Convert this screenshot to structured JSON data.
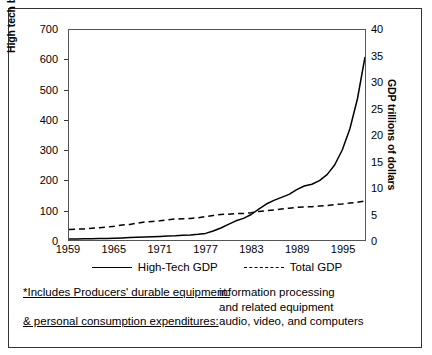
{
  "chart_data": {
    "type": "line",
    "title": "",
    "xlabel": "",
    "x": [
      1959,
      1960,
      1961,
      1962,
      1963,
      1964,
      1965,
      1966,
      1967,
      1968,
      1969,
      1970,
      1971,
      1972,
      1973,
      1974,
      1975,
      1976,
      1977,
      1978,
      1979,
      1980,
      1981,
      1982,
      1983,
      1984,
      1985,
      1986,
      1987,
      1988,
      1989,
      1990,
      1991,
      1992,
      1993,
      1994,
      1995,
      1996,
      1997,
      1998
    ],
    "xtick_labels": [
      "1959",
      "1965",
      "1971",
      "1977",
      "1983",
      "1989",
      "1995"
    ],
    "xticks": [
      1959,
      1965,
      1971,
      1977,
      1983,
      1989,
      1995
    ],
    "xlim": [
      1959,
      1998
    ],
    "grid": false,
    "legend_position": "below-plot",
    "left_axis": {
      "label": "High tech billions of dollars",
      "ylim": [
        0,
        700
      ],
      "ticks": [
        0,
        100,
        200,
        300,
        400,
        500,
        600,
        700
      ],
      "tick_labels": [
        "0",
        "100",
        "200",
        "300",
        "400",
        "500",
        "600",
        "700"
      ],
      "units": "billions of dollars"
    },
    "right_axis": {
      "label": "GDP trillions of dollars",
      "ylim": [
        0,
        40
      ],
      "ticks": [
        0,
        5,
        10,
        15,
        20,
        25,
        30,
        35,
        40
      ],
      "tick_labels": [
        "0",
        "5",
        "10",
        "15",
        "20",
        "25",
        "30",
        "35",
        "40"
      ],
      "units": "trillions of dollars"
    },
    "series": [
      {
        "name": "High-Tech GDP",
        "style": "solid",
        "axis": "left",
        "color": "#000000",
        "values": [
          3,
          3,
          4,
          4,
          5,
          5,
          6,
          7,
          8,
          9,
          10,
          11,
          12,
          13,
          14,
          16,
          17,
          19,
          22,
          30,
          40,
          52,
          64,
          72,
          85,
          103,
          120,
          132,
          142,
          152,
          168,
          180,
          186,
          198,
          218,
          250,
          300,
          370,
          470,
          610
        ]
      },
      {
        "name": "Total GDP",
        "style": "dashed",
        "axis": "left",
        "color": "#000000",
        "values": [
          35,
          36,
          37,
          39,
          41,
          43,
          46,
          50,
          52,
          56,
          60,
          62,
          64,
          67,
          70,
          71,
          72,
          74,
          78,
          82,
          85,
          86,
          88,
          88,
          91,
          95,
          98,
          100,
          103,
          106,
          109,
          110,
          111,
          113,
          115,
          118,
          120,
          123,
          126,
          130
        ]
      }
    ],
    "annotations": {
      "crossover_year": 1984,
      "crossover_value": 95
    }
  },
  "legend": {
    "entries": [
      {
        "label": "High-Tech GDP",
        "style": "solid"
      },
      {
        "label": "Total GDP",
        "style": "dashed"
      }
    ]
  },
  "footnotes": [
    {
      "left": "*Includes Producers' durable equipment:",
      "underline": true,
      "right": "information processing"
    },
    {
      "left": "",
      "underline": false,
      "right": "and related equipment"
    },
    {
      "left": "& personal consumption expenditures:",
      "underline": true,
      "right": "audio, video, and computers"
    }
  ]
}
